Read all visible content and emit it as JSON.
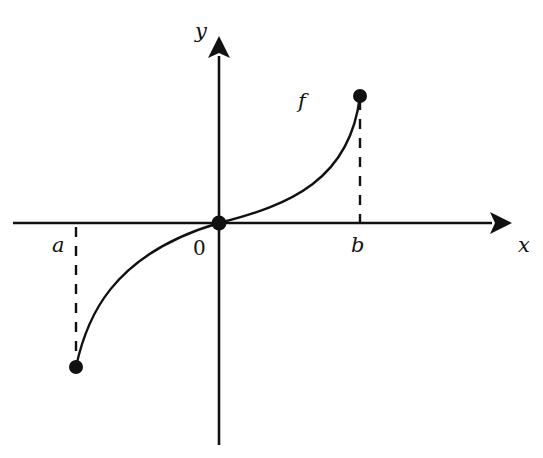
{
  "diagram": {
    "type": "function-graph",
    "labels": {
      "y_axis": "y",
      "x_axis": "x",
      "function": "f",
      "left_endpoint": "a",
      "right_endpoint": "b",
      "origin": "0"
    },
    "colors": {
      "stroke": "#111111",
      "background": "#ffffff"
    },
    "points": [
      {
        "name": "left-endpoint",
        "x": "a",
        "y": "f(a) < 0"
      },
      {
        "name": "origin",
        "x": "0",
        "y": "0"
      },
      {
        "name": "right-endpoint",
        "x": "b",
        "y": "f(b) > 0"
      }
    ]
  }
}
